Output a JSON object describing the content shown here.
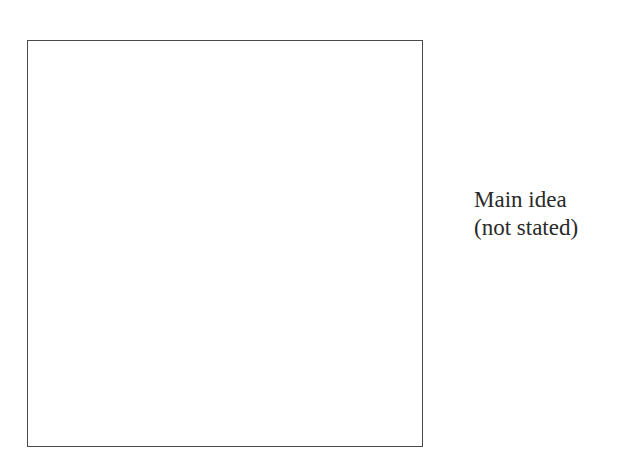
{
  "diagram": {
    "box": {
      "content": ""
    },
    "label": {
      "lines": [
        "Main idea",
        "(not stated)"
      ]
    }
  }
}
